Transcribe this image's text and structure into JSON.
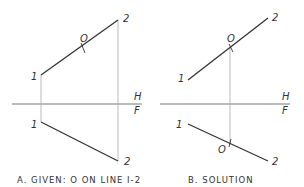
{
  "panels": [
    {
      "id": "A",
      "caption": "A. GIVEN: O ON LINE I-2",
      "labels": {
        "top_1": "1",
        "top_2": "2",
        "top_o": "O",
        "bottom_1": "1",
        "bottom_2": "2",
        "H": "H",
        "F": "F"
      }
    },
    {
      "id": "B",
      "caption": "B. SOLUTION",
      "labels": {
        "top_1": "1",
        "top_2": "2",
        "top_o": "O",
        "bottom_1": "1",
        "bottom_2": "2",
        "bottom_o": "O",
        "H": "H",
        "F": "F"
      }
    }
  ],
  "colors": {
    "line": "#333333",
    "projector": "#b0b0b0"
  }
}
